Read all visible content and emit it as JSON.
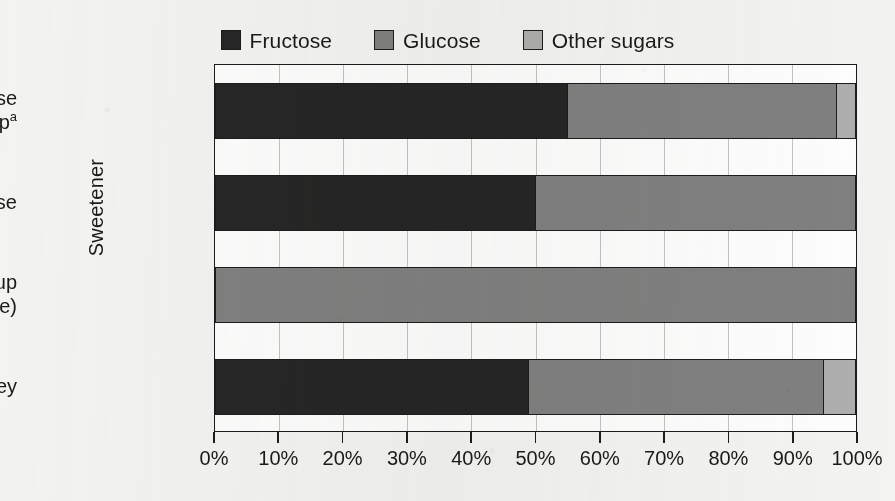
{
  "chart_data": {
    "type": "bar",
    "orientation": "horizontal",
    "stacked": true,
    "stack_mode": "percent",
    "title": "",
    "xlabel": "",
    "ylabel": "Sweetener",
    "xlim": [
      0,
      100
    ],
    "xtick_labels": [
      "0%",
      "10%",
      "20%",
      "30%",
      "40%",
      "50%",
      "60%",
      "70%",
      "80%",
      "90%",
      "100%"
    ],
    "xtick_values": [
      0,
      10,
      20,
      30,
      40,
      50,
      60,
      70,
      80,
      90,
      100
    ],
    "grid": true,
    "grid_axis": "x",
    "legend_position": "top-center",
    "categories": [
      "High-fructose corn syrup",
      "Sucrose",
      "Corn syrup (regular type)",
      "Honey"
    ],
    "category_labels": [
      {
        "line1": "High-fructose",
        "line2": "corn syrup",
        "superscript": "a"
      },
      {
        "line1": "Sucrose",
        "line2": "",
        "superscript": ""
      },
      {
        "line1": "Corn syrup",
        "line2": "(regular type)",
        "superscript": ""
      },
      {
        "line1": "Honey",
        "line2": "",
        "superscript": ""
      }
    ],
    "series": [
      {
        "name": "Fructose",
        "color": "#262626",
        "values": [
          55,
          50,
          0,
          49
        ]
      },
      {
        "name": "Glucose",
        "color": "#808080",
        "values": [
          42,
          50,
          100,
          46
        ]
      },
      {
        "name": "Other sugars",
        "color": "#aeaeae",
        "values": [
          3,
          0,
          0,
          5
        ]
      }
    ],
    "footnote_marker": "a"
  },
  "legend": {
    "items": [
      {
        "label": "Fructose",
        "color": "#262626"
      },
      {
        "label": "Glucose",
        "color": "#808080"
      },
      {
        "label": "Other sugars",
        "color": "#aeaeae"
      }
    ]
  },
  "axes": {
    "y_title": "Sweetener"
  }
}
